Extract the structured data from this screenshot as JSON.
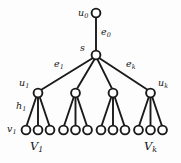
{
  "figure": {
    "background_color": "#fdfdfd",
    "stroke_color": "#1a1a1a",
    "node_fill": "#ffffff",
    "node_radius": 4.4,
    "node_stroke_width": 1.9,
    "edge_stroke_width": 1.9,
    "width": 181,
    "height": 163
  },
  "nodes": {
    "root": {
      "id": "u0",
      "cx": 96,
      "cy": 13
    },
    "hub": {
      "id": "s",
      "cx": 96,
      "cy": 55
    },
    "branch": [
      {
        "id": "u1",
        "cx": 38,
        "cy": 93
      },
      {
        "id": "u2",
        "cx": 75.5,
        "cy": 93
      },
      {
        "id": "u3",
        "cx": 113,
        "cy": 93
      },
      {
        "id": "uk",
        "cx": 150.5,
        "cy": 93
      }
    ],
    "leaves": [
      {
        "cx": 26,
        "cy": 130
      },
      {
        "cx": 38,
        "cy": 130
      },
      {
        "cx": 50,
        "cy": 130
      },
      {
        "cx": 63.5,
        "cy": 130
      },
      {
        "cx": 75.5,
        "cy": 130
      },
      {
        "cx": 87.5,
        "cy": 130
      },
      {
        "cx": 101,
        "cy": 130
      },
      {
        "cx": 113,
        "cy": 130
      },
      {
        "cx": 125,
        "cy": 130
      },
      {
        "cx": 138.5,
        "cy": 130
      },
      {
        "cx": 150.5,
        "cy": 130
      },
      {
        "cx": 162.5,
        "cy": 130
      }
    ]
  },
  "edges": [
    {
      "name": "e0",
      "x1": 96,
      "y1": 17.4,
      "x2": 96,
      "y2": 50.6
    },
    {
      "name": "e1",
      "x1": 92.5,
      "y1": 58.2,
      "x2": 41.3,
      "y2": 89.8
    },
    {
      "name": "s-u2",
      "x1": 94.5,
      "y1": 59.3,
      "x2": 77,
      "y2": 88.7
    },
    {
      "name": "s-u3",
      "x1": 97.5,
      "y1": 59.3,
      "x2": 112,
      "y2": 88.7
    },
    {
      "name": "ek",
      "x1": 99.5,
      "y1": 58.2,
      "x2": 147.5,
      "y2": 89.8
    },
    {
      "name": "h1",
      "x1": 36.2,
      "y1": 97.2,
      "x2": 26.6,
      "y2": 125.8
    },
    {
      "name": "u1-leaf2",
      "x1": 38,
      "y1": 97.4,
      "x2": 38,
      "y2": 125.6
    },
    {
      "name": "u1-leaf3",
      "x1": 39.8,
      "y1": 97.2,
      "x2": 49.4,
      "y2": 125.8
    },
    {
      "name": "u2-leaf1",
      "x1": 73.7,
      "y1": 97.2,
      "x2": 64.1,
      "y2": 125.8
    },
    {
      "name": "u2-leaf2",
      "x1": 75.5,
      "y1": 97.4,
      "x2": 75.5,
      "y2": 125.6
    },
    {
      "name": "u2-leaf3",
      "x1": 77.3,
      "y1": 97.2,
      "x2": 86.9,
      "y2": 125.8
    },
    {
      "name": "u3-leaf1",
      "x1": 111.2,
      "y1": 97.2,
      "x2": 101.6,
      "y2": 125.8
    },
    {
      "name": "u3-leaf2",
      "x1": 113,
      "y1": 97.4,
      "x2": 113,
      "y2": 125.6
    },
    {
      "name": "u3-leaf3",
      "x1": 114.8,
      "y1": 97.2,
      "x2": 124.4,
      "y2": 125.8
    },
    {
      "name": "uk-leaf1",
      "x1": 148.7,
      "y1": 97.2,
      "x2": 139.1,
      "y2": 125.8
    },
    {
      "name": "uk-leaf2",
      "x1": 150.5,
      "y1": 97.4,
      "x2": 150.5,
      "y2": 125.6
    },
    {
      "name": "uk-leaf3",
      "x1": 152.3,
      "y1": 97.2,
      "x2": 161.9,
      "y2": 125.8
    }
  ],
  "labels": {
    "u0": {
      "base": "u",
      "sub": "0",
      "x": 78,
      "y": 8,
      "class": "lbl-node"
    },
    "e0": {
      "base": "e",
      "sub": "0",
      "x": 101,
      "y": 27,
      "class": "lbl-edge"
    },
    "s": {
      "base": "s",
      "sub": "",
      "x": 80,
      "y": 43,
      "class": "lbl-node"
    },
    "e1": {
      "base": "e",
      "sub": "1",
      "x": 54,
      "y": 59,
      "class": "lbl-edge"
    },
    "ek": {
      "base": "e",
      "sub": "k",
      "x": 126,
      "y": 59,
      "class": "lbl-edge"
    },
    "u1": {
      "base": "u",
      "sub": "1",
      "x": 19,
      "y": 78,
      "class": "lbl-node"
    },
    "uk": {
      "base": "u",
      "sub": "k",
      "x": 158,
      "y": 78,
      "class": "lbl-node"
    },
    "h1": {
      "base": "h",
      "sub": "1",
      "x": 16,
      "y": 101,
      "class": "lbl-node"
    },
    "v1": {
      "base": "v",
      "sub": "1",
      "x": 7,
      "y": 124,
      "class": "lbl-node"
    },
    "V1": {
      "base": "V",
      "sub": "1",
      "x": 30,
      "y": 141,
      "class": "lbl-set"
    },
    "Vk": {
      "base": "V",
      "sub": "k",
      "x": 144,
      "y": 141,
      "class": "lbl-set"
    }
  }
}
